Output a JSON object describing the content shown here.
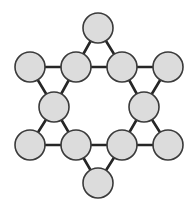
{
  "diagram": {
    "type": "graph",
    "colors": {
      "background": "#ffffff",
      "node_fill": "#dcdcdc",
      "node_stroke": "#3a3a3a",
      "edge": "#262626"
    },
    "node_radius": 15,
    "nodes": [
      {
        "id": "top",
        "x": 98,
        "y": 28
      },
      {
        "id": "upper-left-outer",
        "x": 30,
        "y": 67
      },
      {
        "id": "upper-left-inner",
        "x": 76,
        "y": 67
      },
      {
        "id": "upper-right-inner",
        "x": 122,
        "y": 67
      },
      {
        "id": "upper-right-outer",
        "x": 168,
        "y": 67
      },
      {
        "id": "middle-left",
        "x": 54,
        "y": 107
      },
      {
        "id": "middle-right",
        "x": 144,
        "y": 107
      },
      {
        "id": "lower-left-outer",
        "x": 30,
        "y": 145
      },
      {
        "id": "lower-left-inner",
        "x": 76,
        "y": 145
      },
      {
        "id": "lower-right-inner",
        "x": 122,
        "y": 145
      },
      {
        "id": "lower-right-outer",
        "x": 168,
        "y": 145
      },
      {
        "id": "bottom",
        "x": 98,
        "y": 183
      }
    ],
    "edges": [
      [
        "top",
        "upper-left-inner"
      ],
      [
        "top",
        "upper-right-inner"
      ],
      [
        "upper-left-inner",
        "upper-right-inner"
      ],
      [
        "upper-left-outer",
        "upper-left-inner"
      ],
      [
        "upper-left-outer",
        "middle-left"
      ],
      [
        "upper-left-inner",
        "middle-left"
      ],
      [
        "upper-right-inner",
        "upper-right-outer"
      ],
      [
        "upper-right-inner",
        "middle-right"
      ],
      [
        "upper-right-outer",
        "middle-right"
      ],
      [
        "middle-left",
        "lower-left-outer"
      ],
      [
        "middle-left",
        "lower-left-inner"
      ],
      [
        "lower-left-outer",
        "lower-left-inner"
      ],
      [
        "middle-right",
        "lower-right-inner"
      ],
      [
        "middle-right",
        "lower-right-outer"
      ],
      [
        "lower-right-inner",
        "lower-right-outer"
      ],
      [
        "lower-left-inner",
        "lower-right-inner"
      ],
      [
        "lower-left-inner",
        "bottom"
      ],
      [
        "lower-right-inner",
        "bottom"
      ]
    ]
  }
}
